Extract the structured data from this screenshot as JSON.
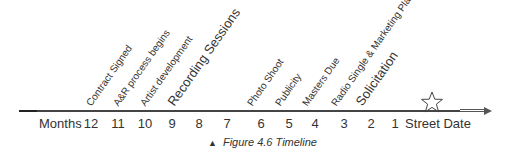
{
  "diagram": {
    "axis_label": "Months",
    "ticks": [
      {
        "label": "12",
        "x": 91
      },
      {
        "label": "11",
        "x": 118
      },
      {
        "label": "10",
        "x": 145
      },
      {
        "label": "9",
        "x": 172
      },
      {
        "label": "8",
        "x": 199
      },
      {
        "label": "7",
        "x": 227
      },
      {
        "label": "6",
        "x": 261
      },
      {
        "label": "5",
        "x": 289
      },
      {
        "label": "4",
        "x": 315
      },
      {
        "label": "3",
        "x": 344
      },
      {
        "label": "2",
        "x": 371
      },
      {
        "label": "1",
        "x": 395
      },
      {
        "label": "Street Date",
        "x": 438
      }
    ],
    "events": [
      {
        "label": "Contract Signed",
        "x": 93,
        "size": 10
      },
      {
        "label": "A&R process begins",
        "x": 120,
        "size": 10
      },
      {
        "label": "Artist development",
        "x": 147,
        "size": 10
      },
      {
        "label": "Recording Sessions",
        "x": 176,
        "size": 13
      },
      {
        "label": "Photo Shoot",
        "x": 254,
        "size": 10
      },
      {
        "label": "Publicity",
        "x": 282,
        "size": 10
      },
      {
        "label": "Masters Due",
        "x": 309,
        "size": 10
      },
      {
        "label": "Radio Single & Marketing Plan",
        "x": 338,
        "size": 10
      },
      {
        "label": "Solicitation",
        "x": 364,
        "size": 13
      }
    ],
    "milestone_icon": "star-outline-icon",
    "milestone_label": "Street Date"
  },
  "caption": {
    "marker": "▲",
    "text": "Figure 4.6 Timeline"
  }
}
